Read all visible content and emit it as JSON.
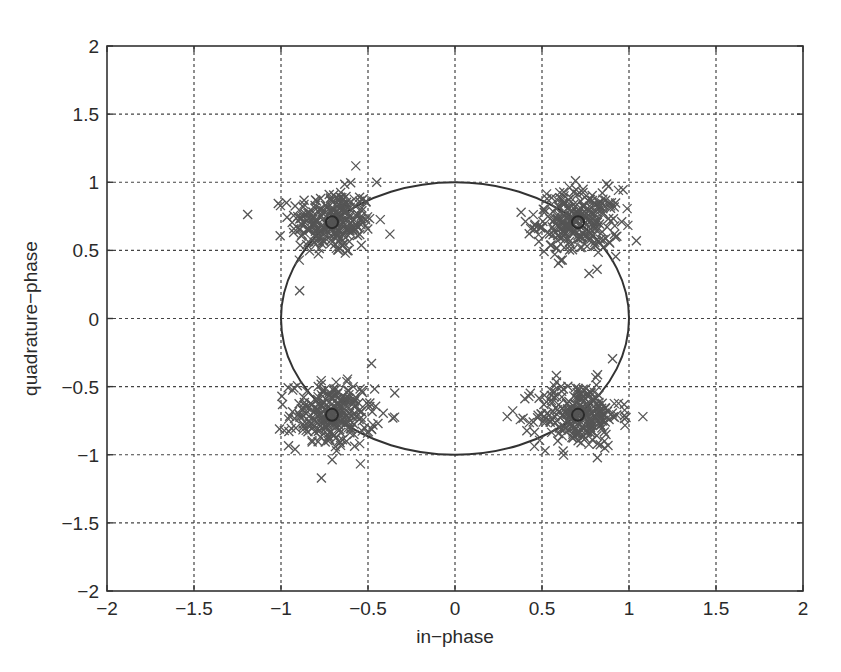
{
  "chart_data": {
    "type": "scatter",
    "title": "",
    "xlabel": "in−phase",
    "ylabel": "quadrature−phase",
    "xlim": [
      -2,
      2
    ],
    "ylim": [
      -2,
      2
    ],
    "grid": true,
    "x_ticks": [
      -2,
      -1.5,
      -1,
      -0.5,
      0,
      0.5,
      1,
      1.5,
      2
    ],
    "y_ticks": [
      -2,
      -1.5,
      -1,
      -0.5,
      0,
      0.5,
      1,
      1.5,
      2
    ],
    "x_tick_labels": [
      "−2",
      "−1.5",
      "−1",
      "−0.5",
      "0",
      "0.5",
      "1",
      "1.5",
      "2"
    ],
    "y_tick_labels": [
      "−2",
      "−1.5",
      "−1",
      "−0.5",
      "0",
      "0.5",
      "1",
      "1.5",
      "2"
    ],
    "legend": null,
    "series": [
      {
        "name": "received symbols",
        "marker": "x",
        "color": "#555555",
        "description": "Noisy QPSK constellation samples clustered around four ideal points",
        "clusters": [
          {
            "center": [
              -0.707,
              0.707
            ],
            "spread": 0.12,
            "count": 250
          },
          {
            "center": [
              0.707,
              0.707
            ],
            "spread": 0.12,
            "count": 250
          },
          {
            "center": [
              -0.707,
              -0.707
            ],
            "spread": 0.12,
            "count": 250
          },
          {
            "center": [
              0.707,
              -0.707
            ],
            "spread": 0.12,
            "count": 250
          }
        ],
        "notable_outliers": [
          [
            -0.57,
            1.12
          ],
          [
            -0.45,
            1.0
          ],
          [
            0.3,
            -0.72
          ],
          [
            1.08,
            -0.72
          ],
          [
            0.77,
            0.33
          ],
          [
            -0.48,
            -0.33
          ],
          [
            0.38,
            0.78
          ]
        ]
      },
      {
        "name": "ideal constellation points",
        "marker": "o",
        "color": "#2a2a2a",
        "points": [
          [
            -0.707,
            0.707
          ],
          [
            0.707,
            0.707
          ],
          [
            -0.707,
            -0.707
          ],
          [
            0.707,
            -0.707
          ]
        ]
      },
      {
        "name": "unit circle",
        "type": "line",
        "color": "#333333",
        "shape": "circle",
        "center": [
          0,
          0
        ],
        "radius": 1
      }
    ]
  },
  "layout": {
    "plot_px": {
      "left": 107,
      "right": 803,
      "top": 46,
      "bottom": 591
    },
    "seed": 12345
  }
}
